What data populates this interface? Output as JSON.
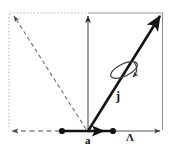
{
  "figure": {
    "background_color": "#ffffff",
    "stroke_color": "#141414",
    "guide_color": "#8c8c8c",
    "frame_color": "#9a9a9a",
    "labels": {
      "base_vector": "a",
      "spin_vector": "j",
      "lattice_vector": "Λ"
    },
    "geometry": {
      "origin": {
        "x": 88,
        "y": 131
      },
      "main_vector_tip": {
        "x": 163,
        "y": 12
      },
      "vertical_axis_tip": {
        "x": 88,
        "y": 13
      },
      "mirror_vector_tip": {
        "x": 11,
        "y": 13
      },
      "left_arrow_tip": {
        "x": 9,
        "y": 131
      },
      "right_arrow_tip": {
        "x": 163,
        "y": 131
      },
      "short_arrow_tip": {
        "x": 107,
        "y": 131
      },
      "node_points": [
        {
          "x": 62,
          "y": 131
        },
        {
          "x": 113,
          "y": 131
        }
      ],
      "frame": {
        "left": 9,
        "top": 13,
        "right": 163,
        "bottom": 131
      }
    },
    "elements": [
      {
        "name": "main-vector",
        "style": "solid-thick-arrow"
      },
      {
        "name": "mirror-vector",
        "style": "dashed-arrow"
      },
      {
        "name": "vertical-axis",
        "style": "thin-arrow"
      },
      {
        "name": "baseline",
        "style": "solid-thick"
      },
      {
        "name": "rotation-ellipse",
        "style": "curved-arrow"
      },
      {
        "name": "bounding-frame",
        "style": "dotted-and-solid"
      }
    ]
  }
}
